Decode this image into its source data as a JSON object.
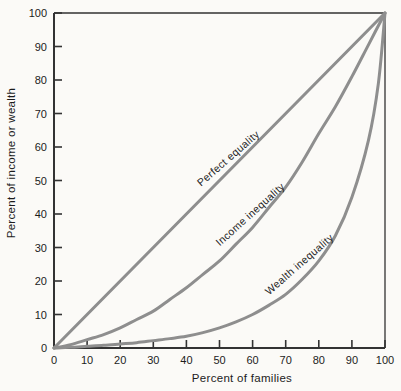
{
  "chart_data": {
    "type": "line",
    "title": "",
    "xlabel": "Percent of families",
    "ylabel": "Percent of income or wealth",
    "xlim": [
      0,
      100
    ],
    "ylim": [
      0,
      100
    ],
    "xticks": [
      0,
      10,
      20,
      30,
      40,
      50,
      60,
      70,
      80,
      90,
      100
    ],
    "yticks": [
      0,
      10,
      20,
      30,
      40,
      50,
      60,
      70,
      80,
      90,
      100
    ],
    "grid": false,
    "legend_position": "labels-on-curves",
    "series": [
      {
        "name": "Perfect equality",
        "points": [
          [
            0,
            0
          ],
          [
            100,
            100
          ]
        ]
      },
      {
        "name": "Income inequality",
        "points": [
          [
            0,
            0
          ],
          [
            5,
            1
          ],
          [
            10,
            2.5
          ],
          [
            15,
            4
          ],
          [
            20,
            6
          ],
          [
            25,
            8.5
          ],
          [
            30,
            11
          ],
          [
            35,
            14.5
          ],
          [
            40,
            18
          ],
          [
            45,
            22
          ],
          [
            50,
            26
          ],
          [
            55,
            31
          ],
          [
            60,
            36
          ],
          [
            65,
            42
          ],
          [
            70,
            48
          ],
          [
            75,
            55.5
          ],
          [
            80,
            64
          ],
          [
            85,
            72
          ],
          [
            90,
            81
          ],
          [
            95,
            90.5
          ],
          [
            100,
            100
          ]
        ]
      },
      {
        "name": "Wealth inequality",
        "points": [
          [
            0,
            0
          ],
          [
            5,
            0.2
          ],
          [
            10,
            0.5
          ],
          [
            15,
            0.8
          ],
          [
            20,
            1.2
          ],
          [
            25,
            1.6
          ],
          [
            30,
            2.2
          ],
          [
            35,
            2.8
          ],
          [
            40,
            3.5
          ],
          [
            45,
            4.6
          ],
          [
            50,
            6
          ],
          [
            55,
            7.8
          ],
          [
            60,
            10
          ],
          [
            65,
            12.8
          ],
          [
            70,
            16
          ],
          [
            75,
            20.5
          ],
          [
            80,
            26
          ],
          [
            85,
            33.5
          ],
          [
            90,
            45
          ],
          [
            95,
            62
          ],
          [
            98,
            79
          ],
          [
            100,
            100
          ]
        ]
      }
    ],
    "colors": {
      "curve": "#8e8e8e",
      "axis": "#333333",
      "text": "#1c1c1c",
      "background": "#fbfaf7"
    }
  }
}
